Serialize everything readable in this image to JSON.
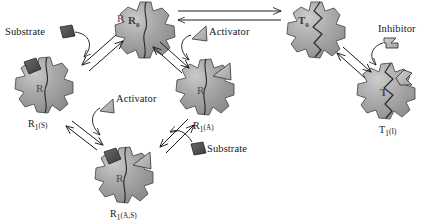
{
  "figure": {
    "type": "biochemistry-diagram",
    "background_color": "#ffffff",
    "ink_color": "#161616",
    "molecule_fill_color": "#9a9a9a",
    "molecule_stroke_color": "#3a3a3a",
    "ligand_dark_color": "#4a4a4a",
    "ligand_light_color": "#b4b4b4"
  },
  "molecules": [
    {
      "id": "R0",
      "label_base": "R",
      "label_sub": "0",
      "inner_letter": "",
      "state": "relaxed-unbound",
      "bound_ligands": []
    },
    {
      "id": "R1S",
      "label_base": "R",
      "label_sub": "1",
      "label_paren": "(S)",
      "inner_letter": "R",
      "state": "relaxed-substrate-bound",
      "bound_ligands": [
        "substrate"
      ]
    },
    {
      "id": "R1A",
      "label_base": "R",
      "label_sub": "1",
      "label_paren": "(A)",
      "inner_letter": "R",
      "state": "relaxed-activator-bound",
      "bound_ligands": [
        "activator"
      ]
    },
    {
      "id": "R1AS",
      "label_base": "R",
      "label_sub": "1",
      "label_paren": "(A,S)",
      "inner_letter": "R",
      "state": "relaxed-activator-and-substrate-bound",
      "bound_ligands": [
        "activator",
        "substrate"
      ]
    },
    {
      "id": "T0",
      "label_base": "T",
      "label_sub": "0",
      "inner_letter": "",
      "state": "tense-unbound",
      "bound_ligands": []
    },
    {
      "id": "T1I",
      "label_base": "T",
      "label_sub": "1",
      "label_paren": "(I)",
      "inner_letter": "T",
      "state": "tense-inhibitor-bound",
      "bound_ligands": [
        "inhibitor"
      ]
    }
  ],
  "labels": {
    "R0": "R",
    "R0_sub": "0",
    "R1S": "R",
    "R1S_sub": "1",
    "R1S_paren": "(S)",
    "R1A": "R",
    "R1A_sub": "1",
    "R1A_paren": "(A)",
    "R1AS": "R",
    "R1AS_sub": "1",
    "R1AS_paren": "(A,S)",
    "T0": "T",
    "T0_sub": "0",
    "T1I": "T",
    "T1I_sub": "1",
    "T1I_paren": "(I)",
    "inner_R0": "R",
    "inner_R1S": "R",
    "inner_R1A": "R",
    "inner_R1AS": "R",
    "inner_T0": "T",
    "inner_T1I": "T"
  },
  "ligands": [
    {
      "id": "substrate-left",
      "name": "Substrate",
      "shape": "square",
      "fill": "dark"
    },
    {
      "id": "activator-top",
      "name": "Activator",
      "shape": "triangle",
      "fill": "light"
    },
    {
      "id": "activator-mid",
      "name": "Activator",
      "shape": "triangle",
      "fill": "light"
    },
    {
      "id": "substrate-right",
      "name": "Substrate",
      "shape": "square",
      "fill": "dark"
    },
    {
      "id": "inhibitor-right",
      "name": "Inhibitor",
      "shape": "flag",
      "fill": "light"
    }
  ],
  "ligand_text": {
    "substrate_left": "Substrate",
    "activator_top": "Activator",
    "activator_mid": "Activator",
    "substrate_right": "Substrate",
    "inhibitor_right": "Inhibitor"
  },
  "equilibria": [
    {
      "id": "R0-T0",
      "from": "R0",
      "to": "T0",
      "style": "double-headed-open-arrow",
      "orientation": "horizontal"
    },
    {
      "id": "R0-R1S",
      "from": "R0",
      "to": "R1S",
      "style": "open-double-arrow",
      "orientation": "diagonal"
    },
    {
      "id": "R0-R1A",
      "from": "R0",
      "to": "R1A",
      "style": "open-double-arrow",
      "orientation": "diagonal"
    },
    {
      "id": "R1S-R1AS",
      "from": "R1S",
      "to": "R1AS",
      "style": "open-double-arrow",
      "orientation": "diagonal"
    },
    {
      "id": "R1A-R1AS",
      "from": "R1A",
      "to": "R1AS",
      "style": "open-double-arrow",
      "orientation": "diagonal"
    },
    {
      "id": "T0-T1I",
      "from": "T0",
      "to": "T1I",
      "style": "open-double-arrow",
      "orientation": "diagonal"
    }
  ],
  "binding_arrows": [
    {
      "id": "substrate-binds-R1S",
      "ligand": "substrate-left",
      "target": "R1S"
    },
    {
      "id": "activator-binds-R1A",
      "ligand": "activator-top",
      "target": "R1A"
    },
    {
      "id": "activator-binds-R1AS",
      "ligand": "activator-mid",
      "target": "R1AS"
    },
    {
      "id": "substrate-binds-R1AS2",
      "ligand": "substrate-right",
      "target": "R1AS"
    },
    {
      "id": "inhibitor-binds-T1I",
      "ligand": "inhibitor-right",
      "target": "T1I"
    }
  ]
}
